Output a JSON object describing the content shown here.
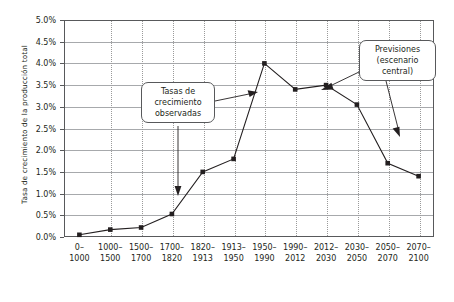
{
  "chart_data": {
    "type": "line",
    "title": "",
    "subtitle": "",
    "xlabel": "",
    "ylabel": "Tasa de crecimiento de la producción total",
    "categories": [
      "0–\n1000",
      "1000–\n1500",
      "1500–\n1700",
      "1700–\n1820",
      "1820–\n1913",
      "1913–\n1950",
      "1950–\n1990",
      "1990–\n2012",
      "2012–\n2030",
      "2030–\n2050",
      "2050–\n2070",
      "2070–\n2100"
    ],
    "values": [
      0.05,
      0.17,
      0.22,
      0.53,
      1.5,
      1.8,
      4.0,
      3.4,
      3.5,
      3.05,
      1.7,
      1.4
    ],
    "value_labels": [
      "0.05%",
      "0.17%",
      "0.22%",
      "0.53%",
      "1.5%",
      "1.8%",
      "4.0%",
      "3.4%",
      "3.5%",
      "3.05%",
      "1.7%",
      "1.4%"
    ],
    "ylim": [
      0.0,
      5.0
    ],
    "ytick_values": [
      0.0,
      0.5,
      1.0,
      1.5,
      2.0,
      2.5,
      3.0,
      3.5,
      4.0,
      4.5,
      5.0
    ],
    "ytick_labels": [
      "0.0%",
      "0.5%",
      "1.0%",
      "1.5%",
      "2.0%",
      "2.5%",
      "3.0%",
      "3.5%",
      "4.0%",
      "4.5%",
      "5.0%"
    ],
    "grid": {
      "horizontal": true,
      "vertical": true,
      "vertical_style": "dotted"
    },
    "legend": {
      "visible": false,
      "position": "none"
    },
    "marker": "square",
    "series_color": "#231f20",
    "grid_color": "#a7a9ac",
    "axis_color": "#58595b",
    "background": "#ffffff",
    "annotations": [
      {
        "name": "observed-growth-callout",
        "text": "Tasas de\ncrecimiento\nobservadas",
        "points_to": [
          "1700–1820",
          "1913–1950"
        ]
      },
      {
        "name": "forecast-callout",
        "text": "Previsiones\n(escenario\ncentral)",
        "points_to": [
          "2012–2030",
          "2050–2070"
        ]
      }
    ]
  }
}
